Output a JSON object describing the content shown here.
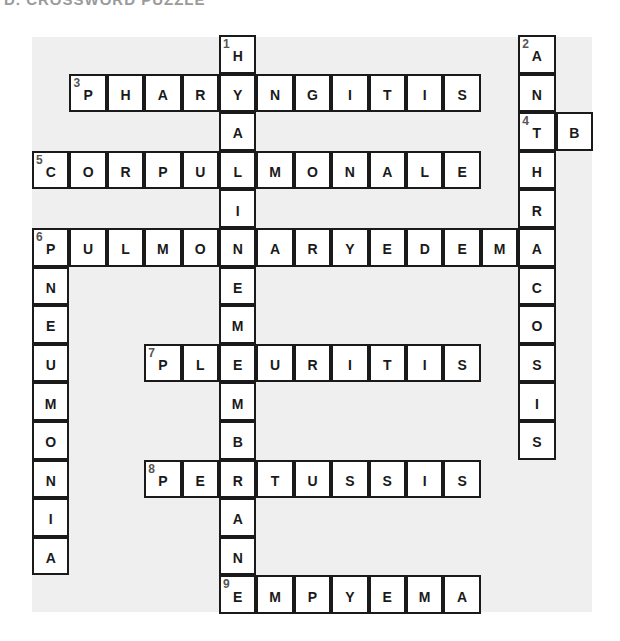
{
  "title": "D. CROSSWORD PUZZLE",
  "grid": {
    "origin_x": 32,
    "origin_y": 35,
    "cell_w": 37.4,
    "cell_h": 38.6,
    "rows": 15,
    "cols": 15
  },
  "entries": [
    {
      "number": 1,
      "direction": "down",
      "answer": "HYALINEMEMBRANE",
      "row": 0,
      "col": 5
    },
    {
      "number": 2,
      "direction": "down",
      "answer": "ANTHRACOSIS",
      "row": 0,
      "col": 13
    },
    {
      "number": 3,
      "direction": "across",
      "answer": "PHARYNGITIS",
      "row": 1,
      "col": 1
    },
    {
      "number": 4,
      "direction": "across",
      "answer": "TB",
      "row": 2,
      "col": 13
    },
    {
      "number": 5,
      "direction": "across",
      "answer": "CORPULMONALE",
      "row": 3,
      "col": 0
    },
    {
      "number": 6,
      "direction": "across",
      "answer": "PULMONARYEDEMA",
      "row": 5,
      "col": 0
    },
    {
      "number": 6,
      "direction": "down",
      "answer": "PNEUMONIA",
      "row": 5,
      "col": 0
    },
    {
      "number": 7,
      "direction": "across",
      "answer": "PLEURITIS",
      "row": 8,
      "col": 3
    },
    {
      "number": 8,
      "direction": "across",
      "answer": "PERTUSSIS",
      "row": 11,
      "col": 3
    },
    {
      "number": 9,
      "direction": "across",
      "answer": "EMPYEMA",
      "row": 14,
      "col": 5
    }
  ]
}
